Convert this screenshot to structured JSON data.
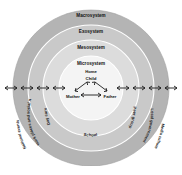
{
  "diagram": {
    "rings": [
      {
        "key": "macrosystem",
        "label": "Macrosystem",
        "color": "#b4b4b4"
      },
      {
        "key": "exosystem",
        "label": "Exosystem",
        "color": "#c9c9c9"
      },
      {
        "key": "mesosystem",
        "label": "Mesosystem",
        "color": "#dcdcdc"
      },
      {
        "key": "microsystem",
        "label": "Microsystem",
        "color": "#f2f2f2"
      }
    ],
    "center": {
      "home_label": "Home",
      "child_label": "Child",
      "mother_label": "Mother",
      "father_label": "Father"
    },
    "mesosystem_items": [
      {
        "key": "day-care",
        "label": "Day care"
      },
      {
        "key": "school",
        "label": "School"
      },
      {
        "key": "peer-group",
        "label": "Peer group"
      }
    ],
    "exosystem_items": [
      {
        "key": "parents-work",
        "label": "Parents' work places and social networks"
      },
      {
        "key": "local-government",
        "label": "Local government"
      }
    ],
    "macrosystem_items": [
      {
        "key": "national-events",
        "label": "National events"
      },
      {
        "key": "media-culture",
        "label": "Media culture"
      }
    ],
    "arrow_color": "#1a1a1a",
    "outline_color": "#9a9a9a"
  }
}
